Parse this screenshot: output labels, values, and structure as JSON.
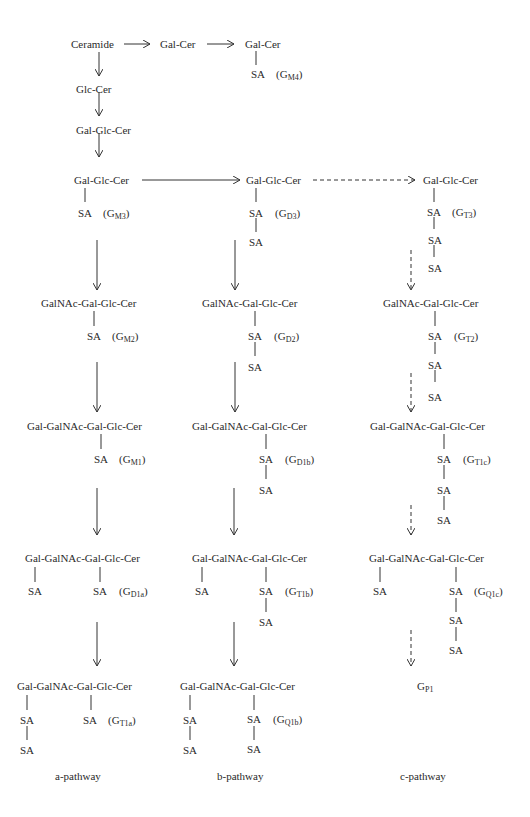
{
  "nodes": {
    "ceramide": "Ceramide",
    "galcer1": "Gal-Cer",
    "galcer2": "Gal-Cer",
    "gm4_sa": "SA",
    "gm4_label": "G",
    "gm4_sub": "M4",
    "glccer": "Glc-Cer",
    "lactosyl": "Gal-Glc-Cer",
    "gm3_chain": "Gal-Glc-Cer",
    "gm3_sa": "SA",
    "gm3_label": "G",
    "gm3_sub": "M3",
    "gd3_chain": "Gal-Glc-Cer",
    "gd3_sa1": "SA",
    "gd3_sa2": "SA",
    "gd3_label": "G",
    "gd3_sub": "D3",
    "gt3_chain": "Gal-Glc-Cer",
    "gt3_sa1": "SA",
    "gt3_sa2": "SA",
    "gt3_sa3": "SA",
    "gt3_label": "G",
    "gt3_sub": "T3",
    "gm2_chain": "GalNAc-Gal-Glc-Cer",
    "gm2_sa": "SA",
    "gm2_label": "G",
    "gm2_sub": "M2",
    "gd2_chain": "GalNAc-Gal-Glc-Cer",
    "gd2_sa1": "SA",
    "gd2_sa2": "SA",
    "gd2_label": "G",
    "gd2_sub": "D2",
    "gt2_chain": "GalNAc-Gal-Glc-Cer",
    "gt2_sa1": "SA",
    "gt2_sa2": "SA",
    "gt2_sa3": "SA",
    "gt2_label": "G",
    "gt2_sub": "T2",
    "gm1_chain": "Gal-GalNAc-Gal-Glc-Cer",
    "gm1_sa": "SA",
    "gm1_label": "G",
    "gm1_sub": "M1",
    "gd1b_chain": "Gal-GalNAc-Gal-Glc-Cer",
    "gd1b_sa1": "SA",
    "gd1b_sa2": "SA",
    "gd1b_label": "G",
    "gd1b_sub": "D1b",
    "gt1c_chain": "Gal-GalNAc-Gal-Glc-Cer",
    "gt1c_sa1": "SA",
    "gt1c_sa2": "SA",
    "gt1c_sa3": "SA",
    "gt1c_label": "G",
    "gt1c_sub": "T1c",
    "gd1a_chain": "Gal-GalNAc-Gal-Glc-Cer",
    "gd1a_saL": "SA",
    "gd1a_sa": "SA",
    "gd1a_label": "G",
    "gd1a_sub": "D1a",
    "gt1b_chain": "Gal-GalNAc-Gal-Glc-Cer",
    "gt1b_saL": "SA",
    "gt1b_sa1": "SA",
    "gt1b_sa2": "SA",
    "gt1b_label": "G",
    "gt1b_sub": "T1b",
    "gq1c_chain": "Gal-GalNAc-Gal-Glc-Cer",
    "gq1c_saL": "SA",
    "gq1c_sa1": "SA",
    "gq1c_sa2": "SA",
    "gq1c_sa3": "SA",
    "gq1c_label": "G",
    "gq1c_sub": "Q1c",
    "gt1a_chain": "Gal-GalNAc-Gal-Glc-Cer",
    "gt1a_saL1": "SA",
    "gt1a_saL2": "SA",
    "gt1a_sa": "SA",
    "gt1a_label": "G",
    "gt1a_sub": "T1a",
    "gq1b_chain": "Gal-GalNAc-Gal-Glc-Cer",
    "gq1b_saL1": "SA",
    "gq1b_saL2": "SA",
    "gq1b_sa1": "SA",
    "gq1b_sa2": "SA",
    "gq1b_label": "G",
    "gq1b_sub": "Q1b",
    "gp1_label": "G",
    "gp1_sub": "P1"
  },
  "pathways": {
    "a": "a-pathway",
    "b": "b-pathway",
    "c": "c-pathway"
  }
}
